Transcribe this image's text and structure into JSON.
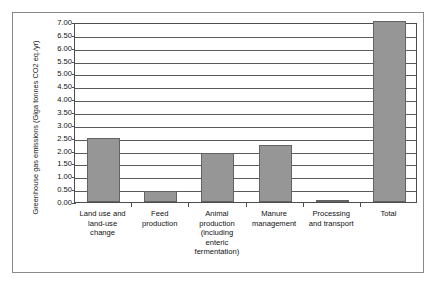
{
  "chart_data": {
    "type": "bar",
    "title": "",
    "xlabel": "",
    "ylabel": "Greenhouse gas emissions (Giga tonnes CO2 eq./yr)",
    "ylim": [
      0.0,
      7.0
    ],
    "grid": true,
    "legend": "none",
    "orientation": "vertical",
    "bar_color": "#969696",
    "bar_edge_color": "#636363",
    "categories": [
      "Land use and land-use change",
      "Feed production",
      "Animal production (including enteric fermentation)",
      "Manure management",
      "Processing and transport",
      "Total"
    ],
    "category_lines": [
      [
        "Land use and",
        "land-use",
        "change"
      ],
      [
        "Feed",
        "production"
      ],
      [
        "Animal",
        "production",
        "(including",
        "enteric",
        "fermentation)"
      ],
      [
        "Manure",
        "management"
      ],
      [
        "Processing",
        "and transport"
      ],
      [
        "Total"
      ]
    ],
    "values": [
      2.5,
      0.41,
      1.9,
      2.2,
      0.03,
      7.05
    ],
    "ytick_labels": [
      "0.00",
      "0.50",
      "1.00",
      "1.50",
      "2.00",
      "2.50",
      "3.00",
      "3.50",
      "4.00",
      "4.50",
      "5.00",
      "5.50",
      "6.00",
      "6.50",
      "7.00"
    ],
    "ytick_values": [
      0.0,
      0.5,
      1.0,
      1.5,
      2.0,
      2.5,
      3.0,
      3.5,
      4.0,
      4.5,
      5.0,
      5.5,
      6.0,
      6.5,
      7.0
    ]
  }
}
